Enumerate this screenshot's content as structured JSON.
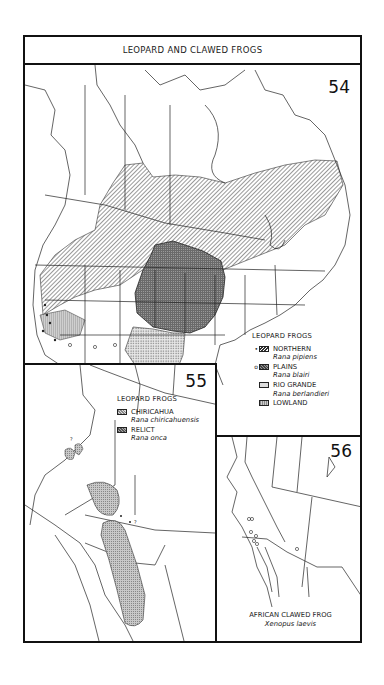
{
  "title": "LEOPARD AND CLAWED FROGS",
  "maps": {
    "map54": {
      "number": "54",
      "legend": {
        "heading": "LEOPARD FROGS",
        "items": [
          {
            "marker": "•",
            "swatch": "diagonal-hatch",
            "name": "NORTHERN",
            "scientific": "Rana pipiens"
          },
          {
            "marker": "o",
            "swatch": "dark-crosshatch",
            "name": "PLAINS",
            "scientific": "Rana blairi"
          },
          {
            "marker": "",
            "swatch": "stipple",
            "name": "RIO GRANDE",
            "scientific": "Rana berlandieri"
          },
          {
            "marker": "",
            "swatch": "light-hatch",
            "name": "LOWLAND",
            "scientific": ""
          }
        ]
      }
    },
    "map55": {
      "number": "55",
      "legend": {
        "heading": "LEOPARD FROGS",
        "items": [
          {
            "swatch": "light-crosshatch",
            "name": "CHIRICAHUA",
            "scientific": "Rana chiricahuensis"
          },
          {
            "swatch": "dark-crosshatch",
            "name": "RELICT",
            "scientific": "Rana onca"
          }
        ]
      },
      "annotations": [
        "?",
        "?"
      ]
    },
    "map56": {
      "number": "56",
      "caption": {
        "name": "AFRICAN CLAWED FROG",
        "scientific": "Xenopus laevis"
      }
    }
  },
  "colors": {
    "ink": "#111111",
    "paper": "#ffffff",
    "range_dark": "#777777",
    "range_light": "#cccccc"
  }
}
